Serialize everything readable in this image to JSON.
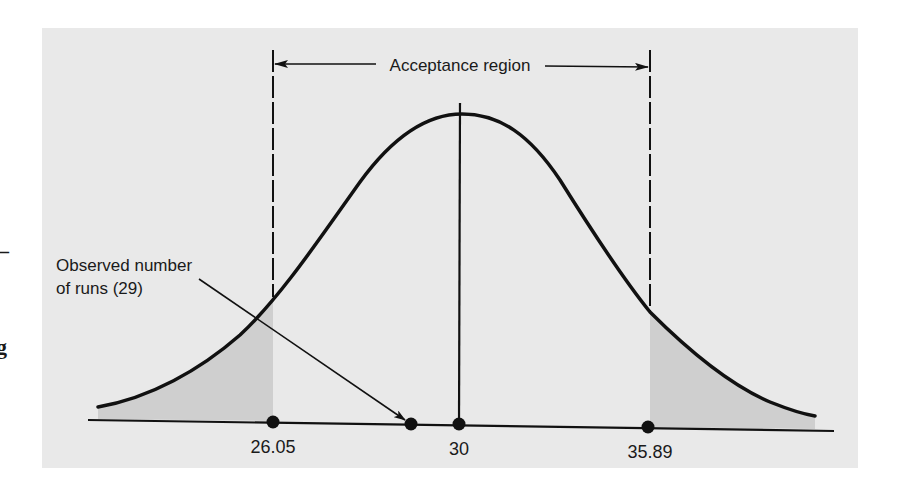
{
  "figure": {
    "type": "normal-distribution-hypothesis-test",
    "acceptance_label": "Acceptance region",
    "observed_label_line1": "Observed number",
    "observed_label_line2": "of runs (29)",
    "ticks": [
      {
        "id": "lower",
        "label": "26.05",
        "value": 26.05
      },
      {
        "id": "mean",
        "label": "30",
        "value": 30
      },
      {
        "id": "upper",
        "label": "35.89",
        "value": 35.89
      }
    ],
    "observed_value": 29,
    "mean": 30,
    "lower_critical": 26.05,
    "upper_critical": 35.89,
    "colors": {
      "panel_background": "#e9e9e9",
      "rejection_shading": "#cfcfcf",
      "ink": "#111111"
    }
  },
  "margin_artifacts": {
    "dash": "–",
    "glyph": "g"
  }
}
